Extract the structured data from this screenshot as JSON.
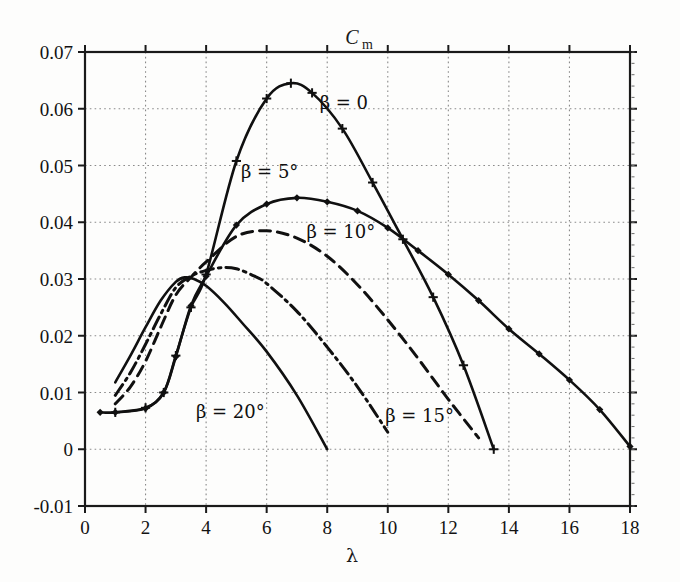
{
  "figure": {
    "title": "C",
    "title_subscript": "m",
    "background_color": "#fdfdfc",
    "axis_color": "#1a1a1a",
    "grid_color": "#8a8a8a",
    "curve_color": "#101010"
  },
  "axes": {
    "x_label": "λ",
    "y_label": "C_m",
    "x_ticks": [
      "0",
      "2",
      "4",
      "6",
      "8",
      "10",
      "12",
      "14",
      "16",
      "18"
    ],
    "x_tick_values": [
      0,
      2,
      4,
      6,
      8,
      10,
      12,
      14,
      16,
      18
    ],
    "y_ticks": [
      "-0.01",
      "0",
      "0.01",
      "0.02",
      "0.03",
      "0.04",
      "0.05",
      "0.06",
      "0.07"
    ],
    "y_tick_values": [
      -0.01,
      0,
      0.01,
      0.02,
      0.03,
      0.04,
      0.05,
      0.06,
      0.07
    ],
    "xlim": [
      0,
      18
    ],
    "ylim": [
      -0.01,
      0.07
    ],
    "grid": "dotted"
  },
  "curve_labels": [
    {
      "id": "label-beta-0",
      "text": "β = 0",
      "x": 8.55,
      "y": 0.06
    },
    {
      "id": "label-beta-5",
      "text": "β = 5°",
      "x": 6.1,
      "y": 0.0478
    },
    {
      "id": "label-beta-10",
      "text": "β = 10°",
      "x": 8.45,
      "y": 0.0372
    },
    {
      "id": "label-beta-15",
      "text": "β = 15°",
      "x": 11.05,
      "y": 0.0048
    },
    {
      "id": "label-beta-20",
      "text": "β = 20°",
      "x": 4.8,
      "y": 0.0055
    }
  ],
  "chart_data": {
    "type": "line",
    "title": "Cm",
    "xlabel": "λ",
    "ylabel": "C_m",
    "xlim": [
      0,
      18
    ],
    "ylim": [
      -0.01,
      0.07
    ],
    "grid": true,
    "legend": "inline-annotations",
    "series": [
      {
        "name": "β = 0",
        "style": "solid",
        "marker": "plus",
        "x": [
          1.0,
          2.0,
          2.6,
          3.0,
          3.5,
          4.0,
          5.0,
          6.0,
          6.8,
          7.5,
          8.5,
          9.5,
          10.5,
          11.5,
          12.5,
          13.5
        ],
        "y": [
          0.0065,
          0.0073,
          0.01,
          0.0165,
          0.025,
          0.0308,
          0.0508,
          0.0618,
          0.0645,
          0.0628,
          0.0565,
          0.047,
          0.037,
          0.0268,
          0.0148,
          0.0
        ]
      },
      {
        "name": "β = 5°",
        "style": "solid",
        "marker": "diamond",
        "x": [
          0.5,
          1.0,
          2.0,
          2.6,
          3.0,
          3.5,
          4.0,
          5.0,
          6.0,
          7.0,
          8.0,
          9.0,
          10.0,
          11.0,
          12.0,
          13.0,
          14.0,
          15.0,
          16.0,
          17.0,
          18.0
        ],
        "y": [
          0.0065,
          0.0065,
          0.0072,
          0.01,
          0.0163,
          0.0253,
          0.0305,
          0.0395,
          0.0432,
          0.0443,
          0.0436,
          0.042,
          0.039,
          0.035,
          0.0308,
          0.0262,
          0.0212,
          0.0168,
          0.0122,
          0.007,
          0.0005
        ]
      },
      {
        "name": "β = 10°",
        "style": "dashed",
        "marker": "none",
        "x": [
          1.0,
          1.5,
          2.0,
          2.5,
          3.0,
          3.5,
          4.0,
          5.0,
          6.0,
          7.0,
          8.0,
          9.0,
          10.0,
          11.0,
          12.0,
          13.0
        ],
        "y": [
          0.008,
          0.011,
          0.0155,
          0.0215,
          0.0272,
          0.0303,
          0.033,
          0.0375,
          0.0385,
          0.0372,
          0.034,
          0.029,
          0.0228,
          0.016,
          0.0088,
          0.002
        ]
      },
      {
        "name": "β = 15°",
        "style": "dashdot",
        "marker": "none",
        "x": [
          1.0,
          1.5,
          2.0,
          2.5,
          3.0,
          3.5,
          4.0,
          4.5,
          5.0,
          5.6,
          6.0,
          7.0,
          8.0,
          9.0,
          10.0
        ],
        "y": [
          0.0095,
          0.0135,
          0.0185,
          0.0238,
          0.0285,
          0.0305,
          0.0315,
          0.032,
          0.0318,
          0.0305,
          0.0292,
          0.0243,
          0.018,
          0.011,
          0.003
        ]
      },
      {
        "name": "β = 20°",
        "style": "solid",
        "marker": "none",
        "x": [
          1.0,
          1.5,
          2.0,
          2.5,
          3.0,
          3.3,
          3.6,
          4.0,
          4.6,
          5.2,
          6.0,
          7.0,
          8.0
        ],
        "y": [
          0.0118,
          0.0165,
          0.0215,
          0.0262,
          0.0295,
          0.0303,
          0.03,
          0.0288,
          0.0258,
          0.0222,
          0.0172,
          0.0095,
          0.0
        ]
      }
    ]
  }
}
